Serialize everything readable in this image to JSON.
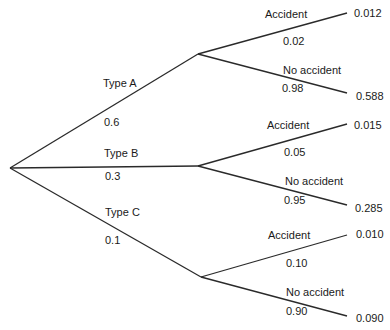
{
  "diagram": {
    "type": "probability-tree",
    "root": "",
    "branches": [
      {
        "label": "Type A",
        "prob": "0.6",
        "children": [
          {
            "label": "Accident",
            "prob": "0.02",
            "joint": "0.012"
          },
          {
            "label": "No accident",
            "prob": "0.98",
            "joint": "0.588"
          }
        ]
      },
      {
        "label": "Type B",
        "prob": "0.3",
        "children": [
          {
            "label": "Accident",
            "prob": "0.05",
            "joint": "0.015"
          },
          {
            "label": "No accident",
            "prob": "0.95",
            "joint": "0.285"
          }
        ]
      },
      {
        "label": "Type C",
        "prob": "0.1",
        "children": [
          {
            "label": "Accident",
            "prob": "0.10",
            "joint": "0.010"
          },
          {
            "label": "No accident",
            "prob": "0.90",
            "joint": "0.090"
          }
        ]
      }
    ]
  },
  "colors": {
    "line": "#2a2a2a",
    "text": "#1a1a1a",
    "background": "#ffffff"
  }
}
